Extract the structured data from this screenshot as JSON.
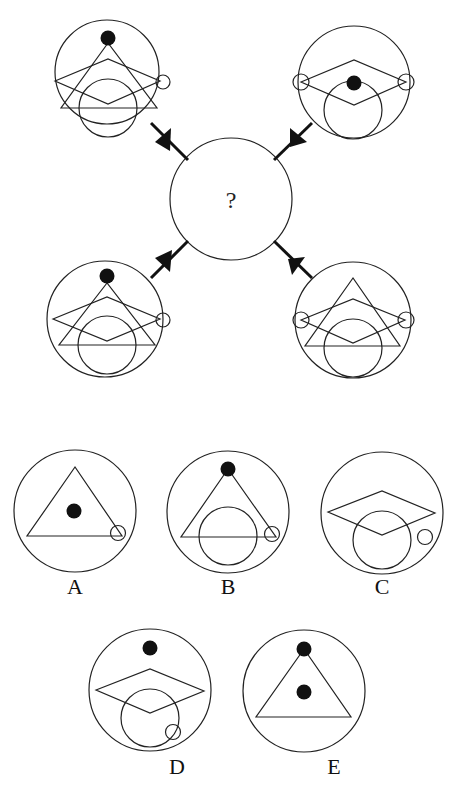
{
  "puzzle": {
    "center": {
      "label": "?"
    },
    "stroke_color": "#222222",
    "fill_color": "#111111",
    "background": "#ffffff",
    "clues": [
      {
        "position": "top-left",
        "shapes": [
          "outer-circle",
          "black-dot-top",
          "triangle",
          "diamond",
          "inner-circle",
          "small-circle-right"
        ]
      },
      {
        "position": "top-right",
        "shapes": [
          "outer-circle",
          "diamond",
          "inner-circle",
          "black-dot-center",
          "small-circle-left",
          "small-circle-right"
        ]
      },
      {
        "position": "bottom-left",
        "shapes": [
          "outer-circle",
          "black-dot-top",
          "triangle",
          "diamond",
          "inner-circle",
          "small-circle-right"
        ]
      },
      {
        "position": "bottom-right",
        "shapes": [
          "outer-circle",
          "triangle",
          "diamond",
          "inner-circle",
          "small-circle-left",
          "small-circle-right"
        ]
      }
    ],
    "options": [
      {
        "label": "A",
        "shapes": [
          "outer-circle",
          "triangle",
          "black-dot-center",
          "small-circle-bottom-right"
        ]
      },
      {
        "label": "B",
        "shapes": [
          "outer-circle",
          "black-dot-top",
          "triangle",
          "inner-circle",
          "small-circle-bottom-right"
        ]
      },
      {
        "label": "C",
        "shapes": [
          "outer-circle",
          "diamond",
          "inner-circle",
          "small-circle-right"
        ]
      },
      {
        "label": "D",
        "shapes": [
          "outer-circle",
          "black-dot-top",
          "diamond",
          "inner-circle",
          "small-circle-bottom-right"
        ]
      },
      {
        "label": "E",
        "shapes": [
          "outer-circle",
          "black-dot-top",
          "triangle",
          "black-dot-center"
        ]
      }
    ]
  }
}
